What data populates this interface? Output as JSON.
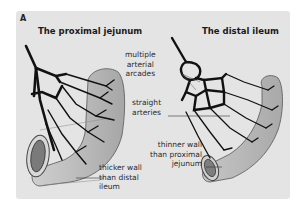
{
  "figure": {
    "label": "A",
    "background_color": "#e4e4e4",
    "vessel_color": "#111111",
    "intestine_fill": "#bdbdbd"
  },
  "left_panel": {
    "title": "The proximal jejunum",
    "labels": {
      "wall": "thicker wall\nthan distal\nileum"
    }
  },
  "right_panel": {
    "title": "The distal ileum",
    "labels": {
      "arcades": "multiple\narterial\narcades",
      "straight": "straight\narteries",
      "wall": "thinner wall\nthan proximal\njejunum"
    }
  }
}
